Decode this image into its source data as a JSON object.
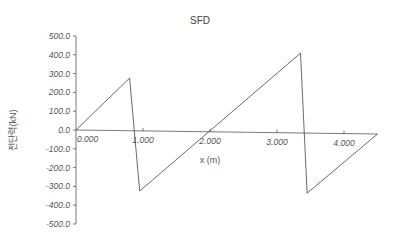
{
  "chart_data": {
    "type": "line",
    "title": "SFD",
    "xlabel": "x (m)",
    "ylabel": "전단력(kN)",
    "ylim": [
      -500,
      500
    ],
    "xlim": [
      0,
      4.5
    ],
    "yticks": [
      "500.0",
      "400.0",
      "300.0",
      "200.0",
      "100.0",
      "0.0",
      "-100.0",
      "-200.0",
      "-300.0",
      "-400.0",
      "-500.0"
    ],
    "xticks": [
      "0.000",
      "1.000",
      "2.000",
      "3.000",
      "4.000"
    ],
    "grid": false,
    "legend": null,
    "series": [
      {
        "name": "Shear Force",
        "x": [
          0.0,
          0.8,
          0.95,
          3.35,
          3.45,
          4.5
        ],
        "y": [
          0,
          280,
          -320,
          425,
          -320,
          0
        ]
      }
    ]
  },
  "colors": {
    "line": "#444444",
    "axis": "#555555",
    "text": "#555555"
  }
}
